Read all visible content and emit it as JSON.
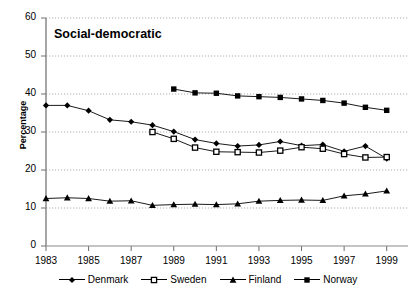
{
  "chart_data": {
    "type": "line",
    "title": "Social-democratic",
    "xlabel": "",
    "ylabel": "Percentage",
    "ylim": [
      0,
      60
    ],
    "xlim": [
      1983,
      2000
    ],
    "ytick_values": [
      0,
      10,
      20,
      30,
      40,
      50,
      60
    ],
    "ytick_labels": [
      "0",
      "10",
      "20",
      "30",
      "40",
      "50",
      "60"
    ],
    "xtick_values": [
      1983,
      1985,
      1987,
      1989,
      1991,
      1993,
      1995,
      1997,
      1999
    ],
    "xtick_labels": [
      "1983",
      "1985",
      "1987",
      "1989",
      "1991",
      "1993",
      "1995",
      "1997",
      "1999"
    ],
    "grid": "horizontal-dotted",
    "legend_position": "bottom",
    "series": [
      {
        "name": "Denmark",
        "marker": "filled-diamond",
        "x": [
          1983,
          1984,
          1985,
          1986,
          1987,
          1988,
          1989,
          1990,
          1991,
          1992,
          1993,
          1994,
          1995,
          1996,
          1997,
          1998,
          1999
        ],
        "values": [
          37.0,
          37.0,
          35.6,
          33.2,
          32.7,
          31.8,
          30.1,
          28.0,
          27.0,
          26.3,
          26.6,
          27.5,
          26.4,
          26.7,
          24.9,
          26.3,
          23.0
        ]
      },
      {
        "name": "Sweden",
        "marker": "open-square",
        "x": [
          1988,
          1989,
          1990,
          1991,
          1992,
          1993,
          1994,
          1995,
          1996,
          1997,
          1998,
          1999
        ],
        "values": [
          30.0,
          28.2,
          25.9,
          24.8,
          24.7,
          24.6,
          25.1,
          26.0,
          25.6,
          24.2,
          23.3,
          23.4
        ]
      },
      {
        "name": "Finland",
        "marker": "filled-triangle",
        "x": [
          1983,
          1984,
          1985,
          1986,
          1987,
          1988,
          1989,
          1990,
          1991,
          1992,
          1993,
          1994,
          1995,
          1996,
          1997,
          1998,
          1999
        ],
        "values": [
          12.5,
          12.7,
          12.5,
          11.8,
          11.9,
          10.7,
          10.9,
          11.0,
          10.9,
          11.1,
          11.8,
          12.0,
          12.1,
          12.0,
          13.2,
          13.7,
          14.5
        ]
      },
      {
        "name": "Norway",
        "marker": "filled-square",
        "x": [
          1989,
          1990,
          1991,
          1992,
          1993,
          1994,
          1995,
          1996,
          1997,
          1998,
          1999
        ],
        "values": [
          41.3,
          40.3,
          40.2,
          39.5,
          39.3,
          39.1,
          38.7,
          38.3,
          37.6,
          36.5,
          35.7
        ]
      }
    ]
  }
}
